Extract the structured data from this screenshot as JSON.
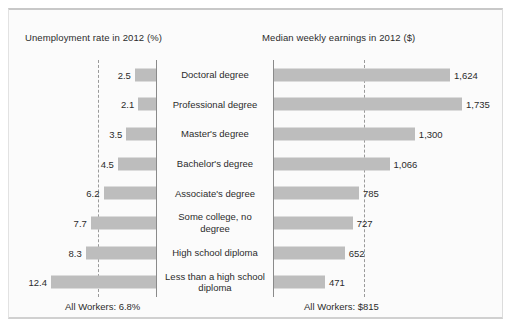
{
  "figure": {
    "left_panel_title": "Unemployment rate in 2012 (%)",
    "right_panel_title": "Median weekly earnings in 2012 ($)",
    "left_footer": "All Workers: 6.8%",
    "right_footer": "All Workers: $815",
    "bar_color": "#bdbdbd",
    "axis_color": "#8a8a8a",
    "average_line_color": "#9a9a9a",
    "background_color": "#fbfbfb"
  },
  "chart_data": {
    "type": "bar",
    "title": "",
    "categories": [
      "Doctoral degree",
      "Professional degree",
      "Master's degree",
      "Bachelor's degree",
      "Associate's degree",
      "Some college, no degree",
      "High school diploma",
      "Less than a high school diploma"
    ],
    "series": [
      {
        "name": "Unemployment rate in 2012 (%)",
        "unit": "%",
        "orientation": "bar-left",
        "values": [
          2.5,
          2.1,
          3.5,
          4.5,
          6.2,
          7.7,
          8.3,
          12.4
        ],
        "labels": [
          "2.5",
          "2.1",
          "3.5",
          "4.5",
          "6.2",
          "7.7",
          "8.3",
          "12.4"
        ],
        "reference_line": 6.8,
        "reference_label": "All Workers: 6.8%",
        "xlabel": "Unemployment rate in 2012 (%)",
        "xlim": [
          0,
          12.4
        ]
      },
      {
        "name": "Median weekly earnings in 2012 ($)",
        "unit": "$",
        "orientation": "bar-right",
        "values": [
          1624,
          1735,
          1300,
          1066,
          785,
          727,
          652,
          471
        ],
        "labels": [
          "1,624",
          "1,735",
          "1,300",
          "1,066",
          "785",
          "727",
          "652",
          "471"
        ],
        "reference_line": 815,
        "reference_label": "All Workers: $815",
        "xlabel": "Median weekly earnings in 2012 ($)",
        "xlim": [
          0,
          1735
        ]
      }
    ],
    "grid": false,
    "legend": "none"
  }
}
